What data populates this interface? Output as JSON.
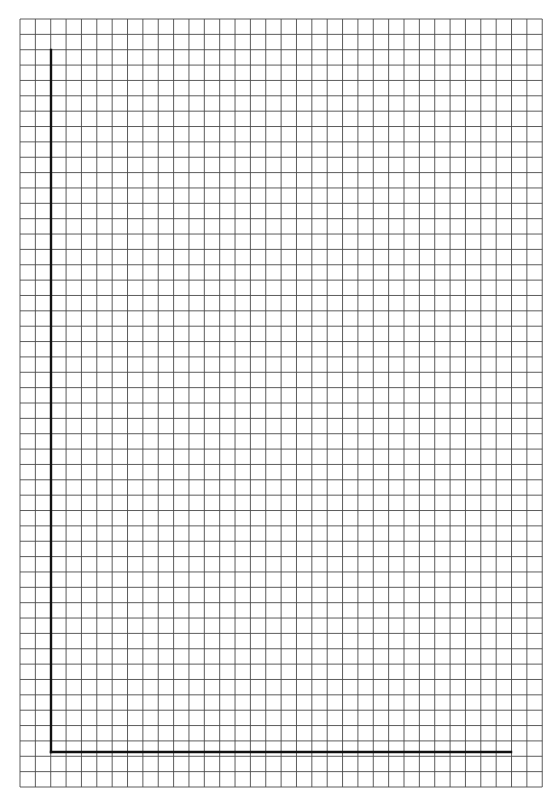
{
  "page": {
    "type": "graph paper with blank axes"
  },
  "grid": {
    "left": 20,
    "top": 19,
    "cols": 34,
    "rows": 50,
    "cell": 15.36,
    "line_color": "#4a4a4a"
  },
  "axes": {
    "origin_x": 51,
    "origin_y": 752,
    "y_axis_top": 50,
    "x_axis_right": 511,
    "color": "#111111"
  }
}
